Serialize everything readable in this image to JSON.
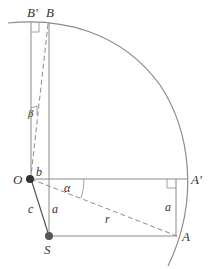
{
  "diagram": {
    "labels": {
      "B_prime": "B′",
      "B": "B",
      "beta": "β",
      "O": "O",
      "b": "b",
      "alpha": "α",
      "A_prime": "A′",
      "c": "c",
      "a_left": "a",
      "a_right": "a",
      "r": "r",
      "S": "S",
      "A": "A"
    },
    "colors": {
      "line": "#8a8a8a",
      "dot": "#333333",
      "text": "#333333"
    }
  }
}
